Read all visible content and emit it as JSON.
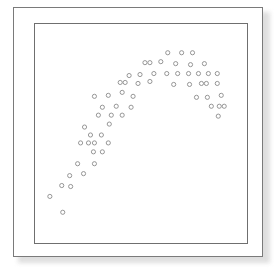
{
  "figure": {
    "title": "",
    "subtitle": "",
    "frame": {
      "outer_border_color": "#7a7a7a",
      "inner_border_color": "#6f6f6f",
      "mat_color": "#ffffff",
      "plot_background": "#ffffff",
      "shadow_color": "#d9d9d9"
    }
  },
  "chart_data": {
    "type": "scatter",
    "title": "",
    "xlabel": "",
    "ylabel": "",
    "xlim": [
      0,
      214
    ],
    "ylim": [
      0,
      221
    ],
    "grid": false,
    "axes_visible": false,
    "tick_labels_x": [],
    "tick_labels_y": [],
    "legend": [],
    "legend_position": "none",
    "annotations": [],
    "marker": {
      "shape": "open-circle",
      "radius": 2.1,
      "stroke_color": "#8a8a8a",
      "fill_color": "none",
      "stroke_width": 0.9
    },
    "series": [
      {
        "name": "points",
        "points": [
          [
            134,
            29
          ],
          [
            148,
            29
          ],
          [
            159,
            29
          ],
          [
            111,
            39
          ],
          [
            116,
            39
          ],
          [
            127,
            38
          ],
          [
            142,
            40
          ],
          [
            157,
            41
          ],
          [
            171,
            40
          ],
          [
            95,
            52
          ],
          [
            106,
            51
          ],
          [
            120,
            50
          ],
          [
            133,
            50
          ],
          [
            144,
            50
          ],
          [
            155,
            50
          ],
          [
            165,
            50
          ],
          [
            175,
            50
          ],
          [
            184,
            50
          ],
          [
            86,
            59
          ],
          [
            91,
            59
          ],
          [
            104,
            60
          ],
          [
            116,
            58
          ],
          [
            140,
            61
          ],
          [
            156,
            61
          ],
          [
            168,
            60
          ],
          [
            173,
            60
          ],
          [
            184,
            60
          ],
          [
            60,
            73
          ],
          [
            74,
            72
          ],
          [
            88,
            69
          ],
          [
            99,
            73
          ],
          [
            163,
            74
          ],
          [
            174,
            74
          ],
          [
            188,
            72
          ],
          [
            68,
            84
          ],
          [
            82,
            83
          ],
          [
            97,
            84
          ],
          [
            178,
            83
          ],
          [
            186,
            83
          ],
          [
            191,
            83
          ],
          [
            64,
            92
          ],
          [
            77,
            92
          ],
          [
            88,
            92
          ],
          [
            185,
            93
          ],
          [
            50,
            104
          ],
          [
            75,
            101
          ],
          [
            56,
            112
          ],
          [
            67,
            112
          ],
          [
            46,
            120
          ],
          [
            54,
            120
          ],
          [
            60,
            120
          ],
          [
            74,
            120
          ],
          [
            59,
            129
          ],
          [
            68,
            129
          ],
          [
            43,
            141
          ],
          [
            60,
            141
          ],
          [
            35,
            153
          ],
          [
            49,
            151
          ],
          [
            27,
            163
          ],
          [
            36,
            164
          ],
          [
            15,
            174
          ],
          [
            28,
            190
          ]
        ]
      }
    ]
  }
}
